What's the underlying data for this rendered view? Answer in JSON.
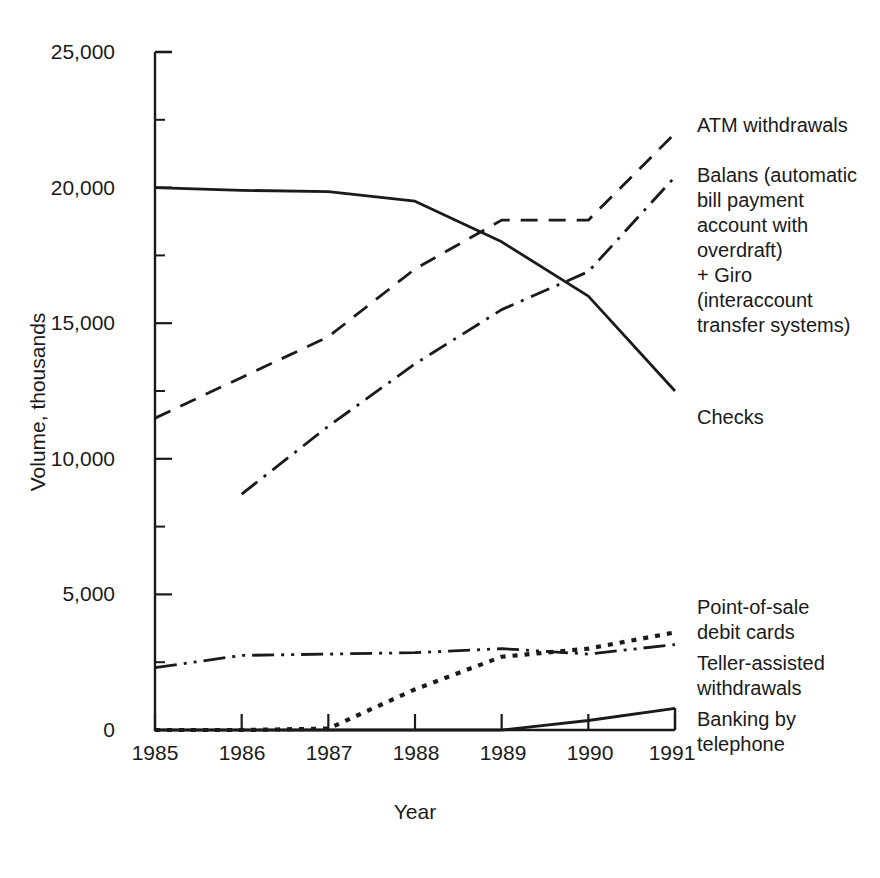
{
  "chart_data": {
    "type": "line",
    "title": "",
    "xlabel": "Year",
    "ylabel": "Volume, thousands",
    "x": [
      1985,
      1986,
      1987,
      1988,
      1989,
      1990,
      1991
    ],
    "xtick_labels": [
      "1985",
      "1986",
      "1987",
      "1988",
      "1989",
      "1990",
      "1991"
    ],
    "ytick_labels": [
      "0",
      "5,000",
      "10,000",
      "15,000",
      "20,000",
      "25,000"
    ],
    "ytick_values": [
      0,
      5000,
      10000,
      15000,
      20000,
      25000
    ],
    "yminor_values": [
      2500,
      7500,
      12500,
      17500,
      22500
    ],
    "xlim": [
      1985,
      1991
    ],
    "ylim": [
      0,
      25000
    ],
    "grid": false,
    "legend_position": "right-of-axes-at-line-ends",
    "series": [
      {
        "name": "ATM withdrawals",
        "style": "dashed",
        "x": [
          1985,
          1986,
          1987,
          1988,
          1989,
          1990,
          1991
        ],
        "values": [
          11500,
          13000,
          14500,
          17000,
          18800,
          18800,
          22000
        ]
      },
      {
        "name": "Balans (automatic bill payment account with overdraft) + Giro (interaccount transfer systems)",
        "style": "dash-dot",
        "x": [
          1986,
          1987,
          1988,
          1989,
          1990,
          1991
        ],
        "values": [
          8700,
          11200,
          13500,
          15500,
          16900,
          20400
        ]
      },
      {
        "name": "Checks",
        "style": "solid",
        "x": [
          1985,
          1986,
          1987,
          1988,
          1989,
          1990,
          1991
        ],
        "values": [
          20000,
          19900,
          19850,
          19500,
          18000,
          16000,
          12500
        ]
      },
      {
        "name": "Point-of-sale debit cards",
        "style": "dotted",
        "x": [
          1985,
          1986,
          1987,
          1988,
          1989,
          1990,
          1991
        ],
        "values": [
          0,
          0,
          50,
          1500,
          2700,
          3000,
          3600
        ]
      },
      {
        "name": "Teller-assisted withdrawals",
        "style": "dash-dot-dot",
        "x": [
          1985,
          1986,
          1987,
          1988,
          1989,
          1990,
          1991
        ],
        "values": [
          2300,
          2750,
          2800,
          2850,
          3000,
          2800,
          3150
        ]
      },
      {
        "name": "Banking by telephone",
        "style": "solid",
        "x": [
          1985,
          1986,
          1987,
          1988,
          1989,
          1990,
          1991
        ],
        "values": [
          0,
          0,
          0,
          0,
          0,
          350,
          800
        ]
      }
    ]
  },
  "labels": {
    "atm": "ATM withdrawals",
    "balans": "Balans (automatic\nbill payment\naccount with\noverdraft)\n+ Giro\n(interaccount\ntransfer systems)",
    "checks": "Checks",
    "pos": "Point-of-sale\ndebit cards",
    "teller": "Teller-assisted\nwithdrawals",
    "phone": "Banking by\ntelephone"
  },
  "axis": {
    "y_title": "Volume, thousands",
    "x_title": "Year",
    "y_ticks": [
      "25,000",
      "20,000",
      "15,000",
      "10,000",
      "5,000",
      "0"
    ],
    "x_ticks": [
      "1985",
      "1986",
      "1987",
      "1988",
      "1989",
      "1990",
      "1991"
    ]
  },
  "colors": {
    "ink": "#1a1a1a",
    "background": "#ffffff"
  }
}
